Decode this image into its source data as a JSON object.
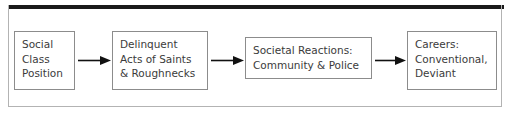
{
  "figure": {
    "type": "flowchart",
    "orientation": "left-to-right",
    "top_rule_color": "#1a1a1a",
    "frame_color": "#b3b3b3",
    "node_border_color": "#8c8c8c",
    "text_color": "#3b3b3b",
    "arrow_color": "#111111",
    "nodes": [
      {
        "id": "social-class-position",
        "lines": [
          "Social",
          "Class",
          "Position"
        ]
      },
      {
        "id": "delinquent-acts",
        "lines": [
          "Delinquent",
          "Acts of Saints",
          "& Roughnecks"
        ]
      },
      {
        "id": "societal-reactions",
        "lines": [
          "Societal Reactions:",
          "Community & Police"
        ]
      },
      {
        "id": "careers",
        "lines": [
          "Careers:",
          "Conventional,",
          "Deviant"
        ]
      }
    ],
    "arrows": [
      {
        "id": "arrow-social-to-delinquent",
        "from": "social-class-position",
        "to": "delinquent-acts",
        "glyph": "arrow-right-icon"
      },
      {
        "id": "arrow-delinquent-to-reactions",
        "from": "delinquent-acts",
        "to": "societal-reactions",
        "glyph": "arrow-right-icon"
      },
      {
        "id": "arrow-reactions-to-careers",
        "from": "societal-reactions",
        "to": "careers",
        "glyph": "arrow-right-icon"
      }
    ]
  }
}
